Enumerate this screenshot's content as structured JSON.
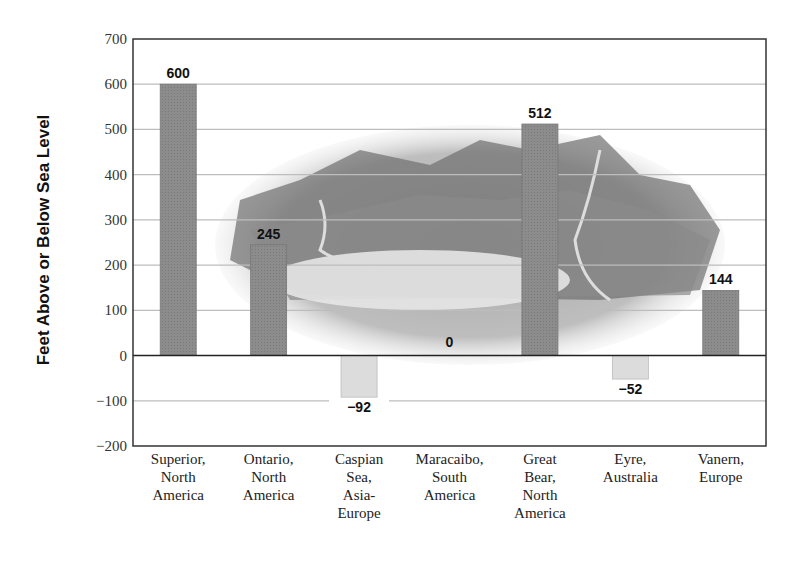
{
  "chart_data": {
    "type": "bar",
    "title": "",
    "xlabel": "",
    "ylabel": "Feet Above or Below Sea Level",
    "ylim": [
      -200,
      700
    ],
    "yticks": [
      700,
      600,
      500,
      400,
      300,
      200,
      100,
      0,
      -100,
      -200
    ],
    "ytick_labels": [
      "700",
      "600",
      "500",
      "400",
      "300",
      "200",
      "100",
      "0",
      "−100",
      "−200"
    ],
    "grid": true,
    "legend": null,
    "categories": [
      "Superior, North America",
      "Ontario, North America",
      "Caspian Sea, Asia-Europe",
      "Maracaibo, South America",
      "Great Bear, North America",
      "Eyre, Australia",
      "Vanern, Europe"
    ],
    "category_labels_multiline": [
      "Superior,\nNorth\nAmerica",
      "Ontario,\nNorth\nAmerica",
      "Caspian\nSea,\nAsia-\nEurope",
      "Maracaibo,\nSouth\nAmerica",
      "Great\nBear,\nNorth\nAmerica",
      "Eyre,\nAustralia",
      "Vanern,\nEurope"
    ],
    "values": [
      600,
      245,
      -92,
      0,
      512,
      -52,
      144
    ],
    "value_labels": [
      "600",
      "245",
      "−92",
      "0",
      "512",
      "−52",
      "144"
    ],
    "background_image": "mountain-lake-illustration",
    "colors": {
      "positive_bar": "#8c8c8c",
      "negative_bar": "#dcdcdc",
      "grid": "#bdbdbd",
      "axis": "#333333"
    }
  }
}
